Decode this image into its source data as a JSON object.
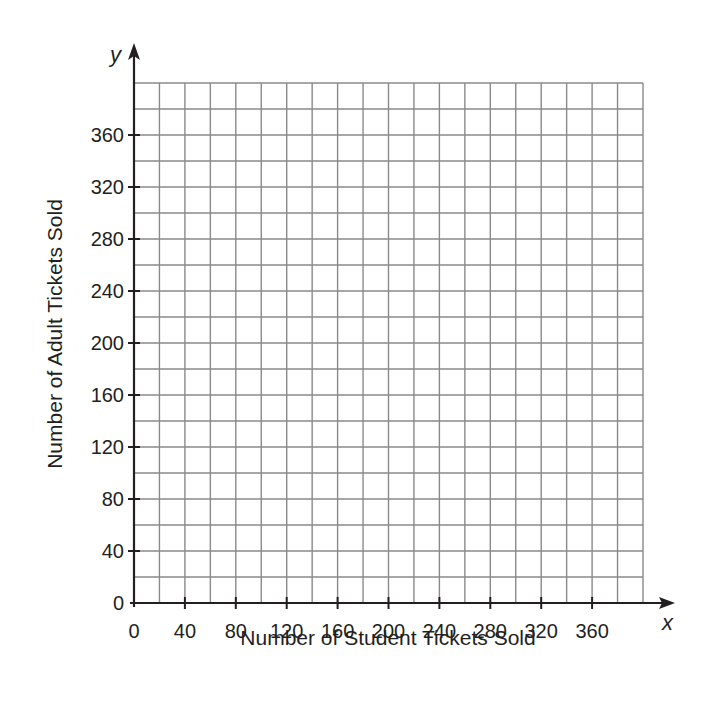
{
  "chart_data": {
    "type": "scatter",
    "title": "",
    "xlabel": "Number of Student Tickets Sold",
    "ylabel": "Number of Adult Tickets Sold",
    "x_axis_var": "x",
    "y_axis_var": "y",
    "xlim": [
      0,
      400
    ],
    "ylim": [
      0,
      400
    ],
    "x_ticks": [
      0,
      40,
      80,
      120,
      160,
      200,
      240,
      280,
      320,
      360
    ],
    "y_ticks": [
      0,
      40,
      80,
      120,
      160,
      200,
      240,
      280,
      320,
      360
    ],
    "grid": true,
    "grid_step": 20,
    "series": [],
    "legend": null
  },
  "colors": {
    "grid": "#8a8a8a",
    "axis": "#231f20",
    "text": "#231f20",
    "background": "#ffffff"
  }
}
